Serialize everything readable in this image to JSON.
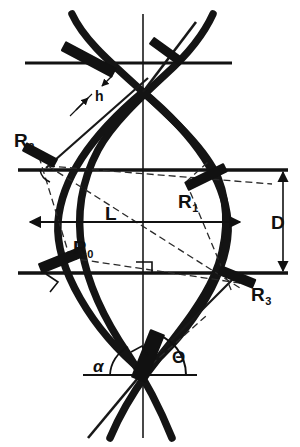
{
  "figure": {
    "kind": "technical-line-diagram",
    "background_color": "#ffffff",
    "ink_color": "#111111",
    "stroke_color": "#1a1a1a",
    "dash_color": "#2a2a2a",
    "width": 300,
    "height": 447
  },
  "labels": {
    "r0": {
      "base": "R",
      "sub": "0",
      "x": 73,
      "y": 238
    },
    "r1": {
      "base": "R",
      "sub": "1",
      "x": 178,
      "y": 192
    },
    "r2": {
      "base": "R",
      "sub": "2",
      "x": 14,
      "y": 131
    },
    "r3": {
      "base": "R",
      "sub": "3",
      "x": 251,
      "y": 285
    },
    "h": {
      "text": "h",
      "x": 95,
      "y": 89
    },
    "l": {
      "text": "L",
      "x": 105,
      "y": 204
    },
    "d": {
      "text": "D",
      "x": 271,
      "y": 213
    },
    "alpha": {
      "text": "α",
      "x": 93,
      "y": 358
    },
    "theta": {
      "text": "Θ",
      "x": 172,
      "y": 349
    }
  },
  "dimensions": {
    "length_label": "L",
    "diameter_label": "D",
    "thickness_label": "h",
    "angle_alpha_label": "α",
    "angle_theta_label": "Θ",
    "radius_labels": [
      "R0",
      "R1",
      "R2",
      "R3"
    ]
  },
  "reference_lines": [
    {
      "name": "upper-horizontal-rule",
      "y": 63,
      "x1": 25,
      "x2": 232
    },
    {
      "name": "middle-horizontal-rule",
      "y": 170,
      "x1": 18,
      "x2": 288
    },
    {
      "name": "lower-horizontal-rule",
      "y": 273,
      "x1": 18,
      "x2": 288
    },
    {
      "name": "bottom-horizontal-rule",
      "y": 375,
      "x1": 83,
      "x2": 197
    },
    {
      "name": "vertical-axis",
      "x": 143,
      "y1": 14,
      "y2": 438
    }
  ]
}
